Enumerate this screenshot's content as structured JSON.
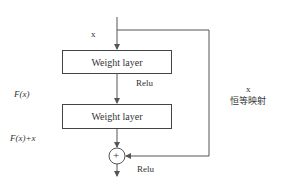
{
  "diagram": {
    "input_label": "x",
    "layers": [
      {
        "label": "Weight layer"
      },
      {
        "label": "Weight layer"
      }
    ],
    "activation_1": "Relu",
    "activation_2": "Relu",
    "residual_label": "F(x)",
    "sum_label": "F(x)+x",
    "shortcut_label": "x",
    "shortcut_caption": "恒等映射",
    "add_symbol": "+",
    "colors": {
      "line": "#555555",
      "text": "#333333",
      "background": "#ffffff"
    }
  }
}
